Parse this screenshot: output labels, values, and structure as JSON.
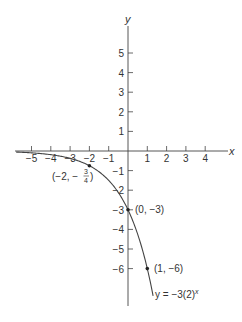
{
  "chart_data": {
    "type": "line",
    "title": "",
    "xlabel": "x",
    "ylabel": "y",
    "xlim": [
      -5.8,
      5
    ],
    "ylim": [
      -7.5,
      6.5
    ],
    "grid": false,
    "x_ticks": [
      -5,
      -4,
      -3,
      -2,
      -1,
      1,
      2,
      3,
      4
    ],
    "x_tick_labels": [
      "−5",
      "−4",
      "−3",
      "−2",
      "−1",
      "1",
      "2",
      "3",
      "4"
    ],
    "y_ticks": [
      5,
      4,
      3,
      2,
      1,
      -1,
      -2,
      -3,
      -4,
      -5,
      -6
    ],
    "y_tick_labels": [
      "5",
      "4",
      "3",
      "2",
      "1",
      "−1",
      "−2",
      "−3",
      "−4",
      "−5",
      "−6"
    ],
    "series": [
      {
        "name": "y = −3(2)^x",
        "function": "-3*2^x",
        "x": [
          -5.8,
          -5,
          -4,
          -3,
          -2,
          -1,
          0,
          0.5,
          1,
          1.3
        ],
        "y": [
          -0.054,
          -0.094,
          -0.1875,
          -0.375,
          -0.75,
          -1.5,
          -3,
          -4.24,
          -6,
          -7.39
        ]
      }
    ],
    "points": [
      {
        "x": -2,
        "y": -0.75,
        "label": "(−2, −3/4)"
      },
      {
        "x": 0,
        "y": -3,
        "label": "(0, −3)"
      },
      {
        "x": 1,
        "y": -6,
        "label": "(1, −6)"
      }
    ],
    "annotations": {
      "curve_label_prefix": "y = −3(2)",
      "curve_label_exp": "x",
      "point_a_prefix": "(−2, −",
      "point_a_num": "3",
      "point_a_den": "4",
      "point_a_suffix": ")",
      "point_b": "(0, −3)",
      "point_c": "(1, −6)"
    }
  }
}
